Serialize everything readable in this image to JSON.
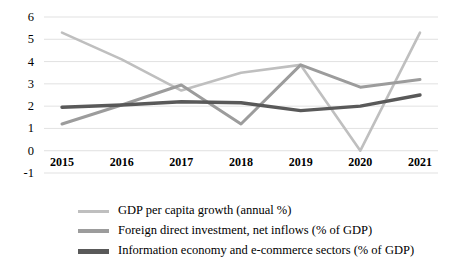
{
  "chart_data": {
    "type": "line",
    "title": "",
    "xlabel": "",
    "ylabel": "",
    "categories": [
      "2015",
      "2016",
      "2017",
      "2018",
      "2019",
      "2020",
      "2021"
    ],
    "ylim": [
      -1,
      6
    ],
    "yticks": [
      "-1",
      "0",
      "1",
      "2",
      "3",
      "4",
      "5",
      "6"
    ],
    "grid": true,
    "legend_position": "bottom-left",
    "series": [
      {
        "name": "GDP per capita growth (annual %)",
        "color": "#bfbfbf",
        "values": [
          5.3,
          4.1,
          2.7,
          3.5,
          3.85,
          0.0,
          5.3
        ]
      },
      {
        "name": "Foreign direct investment, net inflows (% of GDP)",
        "color": "#9c9c9c",
        "values": [
          1.2,
          2.05,
          2.95,
          1.2,
          3.85,
          2.85,
          3.2
        ]
      },
      {
        "name": "Information economy and e-commerce sectors (% of GDP)",
        "color": "#595959",
        "values": [
          1.95,
          2.05,
          2.2,
          2.15,
          1.8,
          2.0,
          2.5
        ]
      }
    ]
  }
}
